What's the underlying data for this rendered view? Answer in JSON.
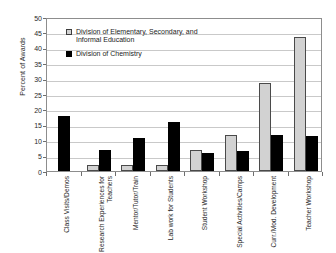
{
  "chart_data": {
    "type": "bar",
    "title": "",
    "xlabel": "",
    "ylabel": "Percent of Awards",
    "ylim": [
      0,
      50
    ],
    "ytick_step": 5,
    "yticks": [
      50,
      45,
      40,
      35,
      30,
      25,
      20,
      15,
      10,
      5,
      0
    ],
    "grid": true,
    "legend_position": "upper-left-inside",
    "categories": [
      "Class Visits/Demos",
      "Research Experiences for Teachers",
      "Mentor/Tutor/Train",
      "Lab work for Students",
      "Student Workshop",
      "Special Activities/Camps",
      "Curr./Mod. Development",
      "Teacher Workshop"
    ],
    "series": [
      {
        "name": "Division of Elementary, Secondary, and Informal Education",
        "color": "#d2d2d2",
        "values": [
          0,
          2.0,
          1.9,
          1.8,
          6.7,
          11.7,
          28.7,
          43.5
        ]
      },
      {
        "name": "Division of Chemistry",
        "color": "#000000",
        "values": [
          18.0,
          6.9,
          10.7,
          15.9,
          5.8,
          6.6,
          11.6,
          11.5
        ]
      }
    ]
  },
  "legend": {
    "entries": [
      "Division of Elementary, Secondary, and Informal Education",
      "Division of Chemistry"
    ]
  },
  "axes": {
    "y_title": "Percent of Awards"
  }
}
